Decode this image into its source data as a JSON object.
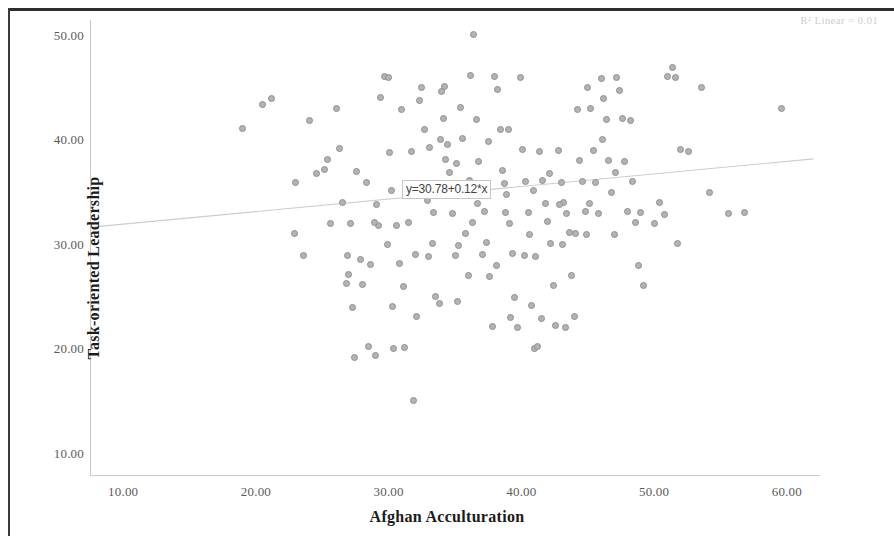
{
  "chart_data": {
    "type": "scatter",
    "title": "",
    "xlabel": "Afghan Acculturation",
    "ylabel": "Task-oriented Leadership",
    "xlim": [
      7.5,
      62.5
    ],
    "ylim": [
      8.0,
      51.5
    ],
    "xticks": [
      "10.00",
      "20.00",
      "30.00",
      "40.00",
      "50.00",
      "60.00"
    ],
    "xtick_values": [
      10,
      20,
      30,
      40,
      50,
      60
    ],
    "yticks": [
      "10.00",
      "20.00",
      "30.00",
      "40.00",
      "50.00"
    ],
    "ytick_values": [
      10,
      20,
      30,
      40,
      50
    ],
    "grid": false,
    "legend": "none",
    "annotations": {
      "r2_label": "R² Linear = 0.01",
      "equation_label": "y=30.78+0.12*x"
    },
    "fit_line": {
      "type": "linear",
      "intercept": 30.78,
      "slope": 0.12,
      "r_squared": 0.01,
      "x_start": 7.8,
      "x_end": 62.0,
      "y_start": 31.72,
      "y_end": 38.22
    },
    "marker": {
      "shape": "circle",
      "fill_color": "#b3b3b3",
      "edge_color": "#8f8f8f",
      "size_px": 7
    },
    "n_points": 178,
    "points": [
      [
        19.0,
        41.1
      ],
      [
        20.5,
        43.4
      ],
      [
        21.2,
        44.0
      ],
      [
        23.0,
        36.0
      ],
      [
        24.0,
        41.9
      ],
      [
        24.6,
        36.8
      ],
      [
        25.2,
        37.2
      ],
      [
        25.4,
        38.2
      ],
      [
        25.6,
        32.0
      ],
      [
        26.1,
        43.0
      ],
      [
        26.3,
        39.2
      ],
      [
        26.5,
        34.1
      ],
      [
        26.8,
        26.3
      ],
      [
        27.0,
        27.2
      ],
      [
        27.1,
        32.0
      ],
      [
        27.3,
        24.0
      ],
      [
        27.4,
        19.2
      ],
      [
        27.6,
        37.0
      ],
      [
        27.9,
        28.6
      ],
      [
        28.0,
        26.2
      ],
      [
        28.3,
        36.0
      ],
      [
        28.5,
        20.3
      ],
      [
        28.6,
        28.1
      ],
      [
        29.0,
        19.4
      ],
      [
        29.1,
        33.9
      ],
      [
        29.4,
        44.1
      ],
      [
        29.7,
        46.1
      ],
      [
        29.9,
        30.0
      ],
      [
        30.0,
        46.0
      ],
      [
        30.2,
        35.2
      ],
      [
        30.4,
        20.1
      ],
      [
        30.6,
        31.9
      ],
      [
        30.8,
        28.2
      ],
      [
        31.0,
        42.9
      ],
      [
        31.2,
        20.2
      ],
      [
        31.4,
        35.8
      ],
      [
        31.7,
        38.9
      ],
      [
        31.9,
        15.1
      ],
      [
        32.1,
        23.2
      ],
      [
        32.3,
        43.8
      ],
      [
        32.5,
        45.0
      ],
      [
        32.7,
        41.0
      ],
      [
        32.9,
        34.2
      ],
      [
        33.1,
        39.3
      ],
      [
        33.3,
        30.1
      ],
      [
        33.5,
        25.1
      ],
      [
        33.8,
        24.4
      ],
      [
        34.0,
        44.7
      ],
      [
        34.2,
        45.1
      ],
      [
        34.4,
        39.6
      ],
      [
        34.6,
        36.9
      ],
      [
        34.8,
        33.0
      ],
      [
        35.0,
        29.0
      ],
      [
        35.2,
        24.6
      ],
      [
        35.4,
        43.1
      ],
      [
        35.6,
        40.2
      ],
      [
        35.8,
        31.1
      ],
      [
        36.0,
        27.1
      ],
      [
        36.2,
        46.2
      ],
      [
        36.4,
        50.1
      ],
      [
        36.6,
        42.0
      ],
      [
        36.8,
        38.0
      ],
      [
        37.0,
        35.0
      ],
      [
        37.2,
        33.2
      ],
      [
        37.4,
        30.2
      ],
      [
        37.6,
        27.0
      ],
      [
        37.8,
        22.2
      ],
      [
        38.0,
        46.1
      ],
      [
        38.2,
        44.9
      ],
      [
        38.4,
        41.0
      ],
      [
        38.6,
        37.1
      ],
      [
        38.7,
        35.9
      ],
      [
        38.9,
        34.8
      ],
      [
        39.1,
        32.0
      ],
      [
        39.3,
        29.2
      ],
      [
        39.5,
        25.0
      ],
      [
        39.7,
        22.1
      ],
      [
        39.9,
        46.0
      ],
      [
        40.1,
        39.1
      ],
      [
        40.3,
        36.1
      ],
      [
        40.5,
        33.1
      ],
      [
        40.6,
        31.0
      ],
      [
        40.8,
        24.2
      ],
      [
        41.0,
        20.1
      ],
      [
        41.2,
        20.3
      ],
      [
        41.4,
        38.9
      ],
      [
        41.6,
        36.2
      ],
      [
        41.8,
        34.0
      ],
      [
        42.0,
        32.2
      ],
      [
        42.2,
        30.1
      ],
      [
        42.4,
        26.1
      ],
      [
        42.6,
        22.3
      ],
      [
        42.8,
        39.0
      ],
      [
        43.0,
        36.0
      ],
      [
        43.2,
        34.1
      ],
      [
        43.4,
        33.0
      ],
      [
        43.6,
        31.2
      ],
      [
        43.8,
        27.1
      ],
      [
        44.0,
        23.2
      ],
      [
        44.2,
        42.9
      ],
      [
        44.4,
        38.1
      ],
      [
        44.6,
        36.1
      ],
      [
        44.8,
        33.2
      ],
      [
        45.0,
        45.0
      ],
      [
        45.2,
        43.0
      ],
      [
        45.4,
        39.0
      ],
      [
        45.6,
        36.0
      ],
      [
        45.8,
        33.0
      ],
      [
        46.0,
        45.9
      ],
      [
        46.2,
        44.0
      ],
      [
        46.4,
        42.0
      ],
      [
        46.6,
        38.1
      ],
      [
        46.8,
        35.0
      ],
      [
        47.0,
        31.0
      ],
      [
        47.2,
        46.0
      ],
      [
        47.4,
        44.8
      ],
      [
        47.6,
        42.1
      ],
      [
        47.8,
        38.0
      ],
      [
        48.0,
        33.2
      ],
      [
        48.2,
        41.9
      ],
      [
        48.4,
        36.1
      ],
      [
        48.6,
        32.1
      ],
      [
        48.8,
        28.0
      ],
      [
        49.0,
        33.1
      ],
      [
        49.2,
        26.1
      ],
      [
        50.0,
        32.0
      ],
      [
        50.4,
        34.1
      ],
      [
        50.8,
        32.9
      ],
      [
        51.0,
        46.1
      ],
      [
        51.4,
        47.0
      ],
      [
        51.6,
        46.0
      ],
      [
        51.8,
        30.1
      ],
      [
        52.0,
        39.1
      ],
      [
        52.6,
        38.9
      ],
      [
        53.6,
        45.0
      ],
      [
        54.2,
        35.0
      ],
      [
        55.6,
        33.0
      ],
      [
        56.8,
        33.1
      ],
      [
        59.6,
        43.0
      ],
      [
        23.6,
        29.0
      ],
      [
        22.9,
        31.1
      ],
      [
        30.1,
        38.8
      ],
      [
        33.9,
        40.1
      ],
      [
        34.1,
        42.1
      ],
      [
        34.3,
        38.2
      ],
      [
        35.1,
        37.8
      ],
      [
        36.1,
        36.2
      ],
      [
        36.3,
        32.1
      ],
      [
        37.1,
        29.1
      ],
      [
        38.1,
        28.0
      ],
      [
        39.2,
        23.1
      ],
      [
        40.2,
        29.0
      ],
      [
        41.1,
        28.9
      ],
      [
        42.1,
        36.8
      ],
      [
        43.1,
        30.0
      ],
      [
        44.1,
        31.1
      ],
      [
        45.1,
        34.0
      ],
      [
        46.1,
        40.1
      ],
      [
        47.1,
        36.9
      ],
      [
        33.0,
        28.9
      ],
      [
        31.5,
        32.1
      ],
      [
        29.2,
        31.9
      ],
      [
        34.7,
        35.1
      ],
      [
        36.7,
        34.0
      ],
      [
        38.8,
        33.1
      ],
      [
        40.9,
        35.2
      ],
      [
        42.9,
        33.9
      ],
      [
        44.9,
        31.0
      ],
      [
        39.0,
        41.0
      ],
      [
        37.5,
        39.9
      ],
      [
        35.3,
        29.9
      ],
      [
        33.4,
        33.1
      ],
      [
        31.1,
        26.0
      ],
      [
        28.9,
        32.1
      ],
      [
        26.9,
        29.0
      ],
      [
        30.3,
        24.1
      ],
      [
        32.0,
        29.1
      ],
      [
        43.3,
        22.1
      ],
      [
        41.5,
        23.0
      ]
    ]
  }
}
